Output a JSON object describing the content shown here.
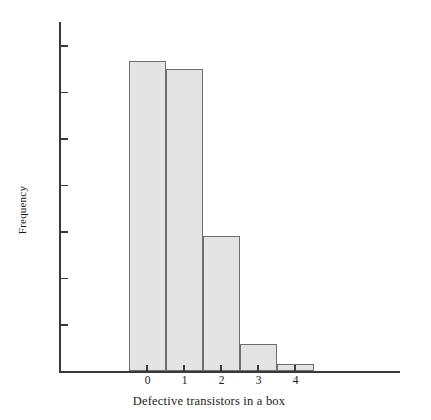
{
  "chart_data": {
    "type": "bar",
    "title": "",
    "subtitle": "",
    "xlabel": "Defective transistors in a box",
    "ylabel": "Frequency",
    "categories": [
      "0",
      "1",
      "2",
      "3",
      "4"
    ],
    "values": [
      40,
      39,
      17.5,
      3.5,
      1
    ],
    "series": [
      {
        "name": "Frequency",
        "values": [
          40,
          39,
          17.5,
          3.5,
          1
        ]
      }
    ],
    "ylim": [
      0,
      45
    ],
    "xlim": [
      -0.5,
      4.5
    ],
    "yticks": [
      6,
      12,
      18,
      24,
      30,
      36,
      42
    ],
    "ytick_labels": [
      "6",
      "12",
      "18",
      "24",
      "30",
      "36",
      "42"
    ],
    "xticks": [
      0,
      1,
      2,
      3,
      4
    ],
    "xtick_labels": [
      "0",
      "1",
      "2",
      "3",
      "4"
    ],
    "grid": false,
    "legend": false,
    "legend_position": "none",
    "bar_fill_color": "#e4e4e4",
    "bar_edge_color": "#6e6e6e",
    "axis_color": "#3a3a3a",
    "background_color": "#ffffff",
    "annotations": []
  }
}
